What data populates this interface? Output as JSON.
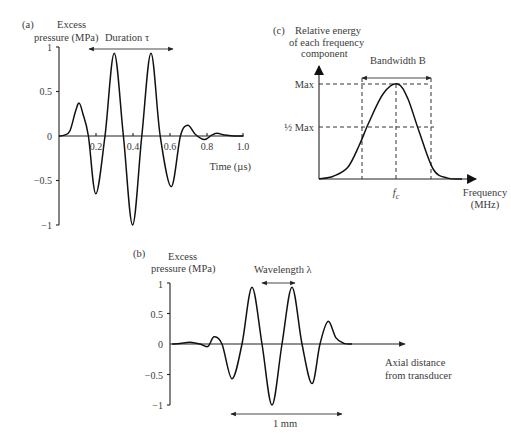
{
  "chart_data": [
    {
      "panel": "(a)",
      "type": "line",
      "title": "",
      "ylabel": "Excess pressure (MPa)",
      "xlabel": "Time (µs)",
      "xlim": [
        0,
        1.0
      ],
      "ylim": [
        -1,
        1
      ],
      "xticks": [
        "0.2",
        "0.4",
        "0.6",
        "0.8",
        "1.0"
      ],
      "yticks": [
        "1",
        "0.5",
        "0",
        "−0.5",
        "−1"
      ],
      "annotation": "Duration τ",
      "annotation_span": [
        0.16,
        0.62
      ],
      "series": [
        {
          "name": "pulse vs time",
          "x": [
            0,
            0.03,
            0.06,
            0.09,
            0.11,
            0.13,
            0.16,
            0.2,
            0.25,
            0.3,
            0.35,
            0.4,
            0.45,
            0.5,
            0.55,
            0.61,
            0.66,
            0.7,
            0.74,
            0.79,
            0.83,
            0.86,
            0.9,
            0.95,
            1.0
          ],
          "y": [
            0,
            0.01,
            0.06,
            0.28,
            0.37,
            0.25,
            0.0,
            -0.65,
            0.0,
            0.93,
            0.0,
            -1.0,
            0.0,
            0.93,
            0.0,
            -0.57,
            0.0,
            0.12,
            0.02,
            -0.04,
            0.01,
            0.03,
            0.01,
            0.0,
            0.0
          ]
        }
      ]
    },
    {
      "panel": "(b)",
      "type": "line",
      "ylabel": "Excess pressure (MPa)",
      "xlabel": "Axial distance from transducer",
      "ylim": [
        -1,
        1
      ],
      "yticks": [
        "1",
        "0.5",
        "0",
        "−0.5",
        "−1"
      ],
      "annotations": [
        {
          "text": "Wavelength λ",
          "type": "span",
          "between": "adjacent peaks"
        },
        {
          "text": "1 mm",
          "type": "span",
          "below": "pulse"
        }
      ],
      "series": [
        {
          "name": "pulse vs distance (mirror of (a))",
          "x": [
            0.0,
            0.04,
            0.09,
            0.14,
            0.18,
            0.21,
            0.25,
            0.3,
            0.35,
            0.4,
            0.45,
            0.5,
            0.55,
            0.6,
            0.65,
            0.7,
            0.74,
            0.78,
            0.82,
            0.86,
            0.9
          ],
          "y": [
            0.0,
            0.01,
            0.03,
            0.0,
            -0.04,
            0.12,
            0.0,
            -0.57,
            0.0,
            0.93,
            0.0,
            -1.0,
            0.0,
            0.93,
            0.0,
            -0.65,
            0.0,
            0.37,
            0.1,
            0.01,
            0.0
          ]
        }
      ]
    },
    {
      "panel": "(c)",
      "type": "line",
      "ylabel": "Relative energy of each frequency component",
      "xlabel": "Frequency (MHz)",
      "yticks": [
        "Max",
        "½ Max"
      ],
      "xticks": [
        "fc"
      ],
      "annotation": "Bandwidth B",
      "series": [
        {
          "name": "spectrum",
          "x": [
            0,
            0.1,
            0.2,
            0.28,
            0.35,
            0.45,
            0.55,
            0.62,
            0.7,
            0.8,
            0.9,
            1.0
          ],
          "y": [
            0,
            0.03,
            0.12,
            0.35,
            0.6,
            0.9,
            1.0,
            0.85,
            0.5,
            0.1,
            0.01,
            0
          ]
        }
      ]
    }
  ],
  "panels": {
    "a": {
      "tag": "(a)",
      "ylabel1": "Excess",
      "ylabel2": "pressure (MPa)",
      "annotation": "Duration τ",
      "xticks": [
        "0.2",
        "0.4",
        "0.6",
        "0.8",
        "1.0"
      ],
      "yticks": [
        "1",
        "0.5",
        "0",
        "−0.5",
        "−1"
      ],
      "xlabel": "Time (µs)"
    },
    "b": {
      "tag": "(b)",
      "ylabel1": "Excess",
      "ylabel2": "pressure (MPa)",
      "annotation": "Wavelength λ",
      "yticks": [
        "1",
        "0.5",
        "0",
        "−0.5",
        "−1"
      ],
      "xlabel1": "Axial distance",
      "xlabel2": "from transducer",
      "scale": "1 mm"
    },
    "c": {
      "tag": "(c)",
      "ylabel1": "Relative energy",
      "ylabel2": "of each frequency",
      "ylabel3": "component",
      "annotation": "Bandwidth B",
      "max": "Max",
      "halfmax": "½ Max",
      "fc": "fc",
      "xlabel1": "Frequency",
      "xlabel2": "(MHz)"
    }
  }
}
